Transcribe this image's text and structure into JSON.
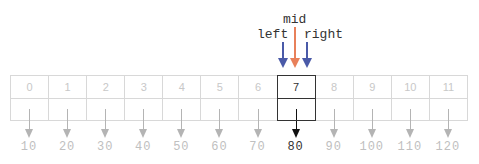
{
  "pointers": [
    {
      "name": "mid",
      "label": "mid",
      "color": "#e8805a",
      "x": 295,
      "label_x": 283,
      "label_y": 13
    },
    {
      "name": "left",
      "label": "left",
      "color": "#4a5aa8",
      "x": 283,
      "label_x": 257,
      "label_y": 28
    },
    {
      "name": "right",
      "label": "right",
      "color": "#4a5aa8",
      "x": 307,
      "label_x": 304,
      "label_y": 28
    }
  ],
  "array": {
    "indices": [
      "0",
      "1",
      "2",
      "3",
      "4",
      "5",
      "6",
      "7",
      "8",
      "9",
      "10",
      "11"
    ],
    "values": [
      "10",
      "20",
      "30",
      "40",
      "50",
      "60",
      "70",
      "80",
      "90",
      "100",
      "110",
      "120"
    ],
    "highlight_index": 7,
    "muted_color": "#c8c8c8",
    "highlight_color": "#333333"
  }
}
